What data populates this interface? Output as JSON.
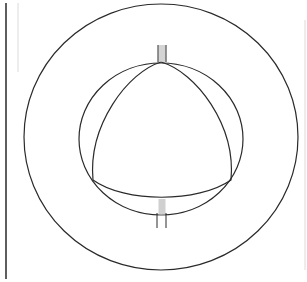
{
  "diagram": {
    "colors": {
      "stroke": "#2a2a2a",
      "border": "#1a1a1a",
      "faint": "#c8c8c8",
      "hatch": "#9a9a9a",
      "background": "#ffffff"
    },
    "shapes": {
      "outer_circle": {
        "cx": 161,
        "cy": 137,
        "rx": 137,
        "ry": 133
      },
      "inner_circle": {
        "cx": 161,
        "cy": 139,
        "rx": 82,
        "ry": 76
      },
      "triangle_vertices": [
        [
          161,
          62
        ],
        [
          93,
          180
        ],
        [
          231,
          180
        ]
      ],
      "top_support": {
        "x": 158,
        "y": 45,
        "w": 8,
        "h": 17
      },
      "bottom_support": {
        "x": 157,
        "y": 199,
        "w": 9,
        "h": 29
      }
    }
  }
}
